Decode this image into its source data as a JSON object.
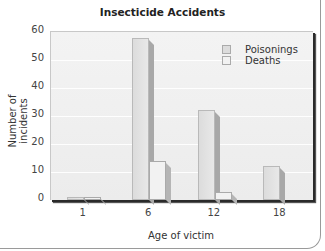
{
  "chart_data": {
    "type": "bar",
    "title": "Insecticide Accidents",
    "xlabel": "Age of victim",
    "ylabel": "Number of incidents",
    "categories": [
      "1",
      "6",
      "12",
      "18"
    ],
    "series": [
      {
        "name": "Poisonings",
        "values": [
          1,
          58,
          32,
          12
        ],
        "color": "#dcdcdc"
      },
      {
        "name": "Deaths",
        "values": [
          1,
          14,
          3,
          0
        ],
        "color": "#f2f2f2"
      }
    ],
    "ylim": [
      0,
      60
    ],
    "yticks": [
      "0",
      "10",
      "20",
      "30",
      "40",
      "50",
      "60"
    ],
    "grid": true,
    "legend_position": "upper right",
    "style": "3d-bar"
  }
}
